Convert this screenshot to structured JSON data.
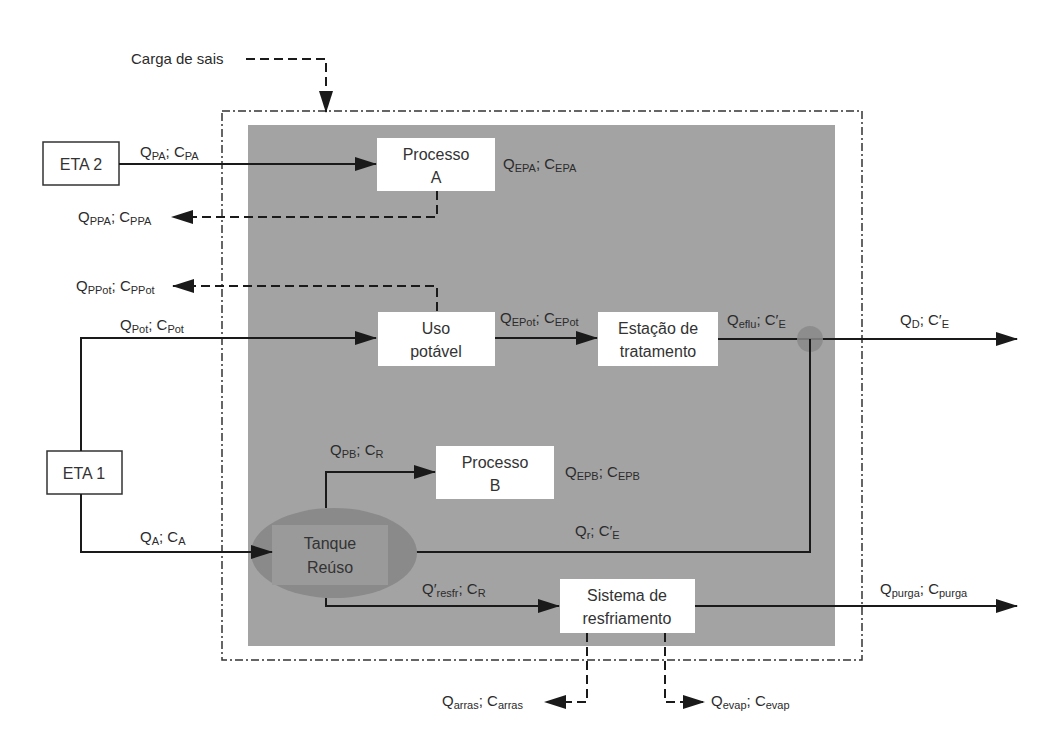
{
  "colors": {
    "system_fill": "#a3a3a3",
    "reuse_tank_fill": "#8a8a8a",
    "reuse_tank_inner": "#9a9a9a",
    "mixing_node": "#8a8a8a",
    "box_fill": "#ffffff",
    "line": "#1a1a1a"
  },
  "salt_load": {
    "label": "Carga de sais"
  },
  "nodes": {
    "eta2": {
      "label": "ETA 2"
    },
    "eta1": {
      "label": "ETA 1"
    },
    "processo_a": {
      "line1": "Processo",
      "line2": "A"
    },
    "uso_potavel": {
      "line1": "Uso",
      "line2": "potável"
    },
    "estacao_tratamento": {
      "line1": "Estação de",
      "line2": "tratamento"
    },
    "processo_b": {
      "line1": "Processo",
      "line2": "B"
    },
    "tanque_reuso": {
      "line1": "Tanque",
      "line2": "Reúso"
    },
    "sistema_resfriamento": {
      "line1": "Sistema de",
      "line2": "resfriamento"
    }
  },
  "flows": {
    "qpa": {
      "q": "Q",
      "qs": "PA",
      "sep": "; ",
      "c": "C",
      "cs": "PA"
    },
    "qepa": {
      "q": "Q",
      "qs": "EPA",
      "sep": "; ",
      "c": "C",
      "cs": "EPA"
    },
    "qppa": {
      "q": "Q",
      "qs": "PPA",
      "sep": "; ",
      "c": "C",
      "cs": "PPA"
    },
    "qppot": {
      "q": "Q",
      "qs": "PPot",
      "sep": "; ",
      "c": "C",
      "cs": "PPot"
    },
    "qpot": {
      "q": "Q",
      "qs": "Pot",
      "sep": "; ",
      "c": "C",
      "cs": "Pot"
    },
    "qepot": {
      "q": "Q",
      "qs": "EPot",
      "sep": "; ",
      "c": "C",
      "cs": "EPot"
    },
    "qeflu": {
      "q": "Q",
      "qs": "eflu",
      "sep": "; ",
      "c": "C′",
      "cs": "E"
    },
    "qd": {
      "q": "Q",
      "qs": "D",
      "sep": "; ",
      "c": "C′",
      "cs": "E"
    },
    "qpb": {
      "q": "Q",
      "qs": "PB",
      "sep": "; ",
      "c": "C",
      "cs": "R"
    },
    "qepb": {
      "q": "Q",
      "qs": "EPB",
      "sep": "; ",
      "c": "C",
      "cs": "EPB"
    },
    "qa": {
      "q": "Q",
      "qs": "A",
      "sep": "; ",
      "c": "C",
      "cs": "A"
    },
    "qr": {
      "q": "Q",
      "qs": "r",
      "sep": "; ",
      "c": "C′",
      "cs": "E"
    },
    "qresfr": {
      "q": "Q′",
      "qs": "resfr",
      "sep": "; ",
      "c": "C",
      "cs": "R"
    },
    "qpurga": {
      "q": "Q",
      "qs": "purga",
      "sep": "; ",
      "c": "C",
      "cs": "purga"
    },
    "qarras": {
      "q": "Q",
      "qs": "arras",
      "sep": "; ",
      "c": "C",
      "cs": "arras"
    },
    "qevap": {
      "q": "Q",
      "qs": "evap",
      "sep": "; ",
      "c": "C",
      "cs": "evap"
    }
  }
}
